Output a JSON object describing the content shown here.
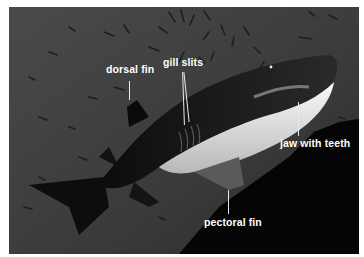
{
  "image": {
    "subject": "sand tiger shark swimming underwater among small fish",
    "style": "grayscale annotated photograph",
    "colors": {
      "water": "#3d3d3d",
      "rock": "#050505",
      "belly": "#e6e6e6",
      "label_text": "#ffffff"
    }
  },
  "labels": [
    {
      "id": "dorsal-fin",
      "text": "dorsal fin"
    },
    {
      "id": "gill-slits",
      "text": "gill slits"
    },
    {
      "id": "jaw-with-teeth",
      "text": "jaw with teeth"
    },
    {
      "id": "pectoral-fin",
      "text": "pectoral fin"
    }
  ]
}
